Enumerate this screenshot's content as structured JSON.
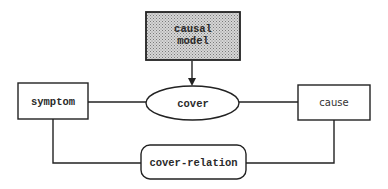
{
  "diagram": {
    "type": "flow-diagram",
    "colors": {
      "stroke": "#222222",
      "background": "#ffffff",
      "shaded_fill_light": "#d8d8d8",
      "shaded_fill_dark": "#8a8a8a",
      "text": "#2a2a2a"
    },
    "nodes": {
      "causal_model": {
        "shape": "shaded-rectangle",
        "line1": "causal",
        "line2": "model"
      },
      "cover": {
        "shape": "ellipse",
        "label": "cover"
      },
      "symptom": {
        "shape": "rectangle",
        "label": "symptom"
      },
      "cause": {
        "shape": "rectangle",
        "label": "cause"
      },
      "cover_relation": {
        "shape": "rounded-rectangle",
        "label": "cover-relation"
      }
    },
    "edges": [
      {
        "from": "causal model",
        "to": "cover",
        "style": "arrow"
      },
      {
        "from": "symptom",
        "to": "cover",
        "style": "line"
      },
      {
        "from": "cover",
        "to": "cause",
        "style": "line"
      },
      {
        "from": "symptom",
        "to": "cover-relation",
        "style": "line"
      },
      {
        "from": "cover-relation",
        "to": "cause",
        "style": "line"
      }
    ]
  }
}
